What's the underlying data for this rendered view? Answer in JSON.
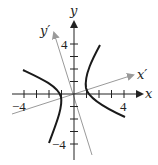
{
  "diagram": {
    "title": "",
    "colors": {
      "axis": "#222222",
      "rotated_axis": "#9a9a9a",
      "curve": "#1a1a1a",
      "background": "#ffffff"
    },
    "axes": {
      "x": {
        "label": "x",
        "tick_labels": [
          {
            "value": -4,
            "text": "−4"
          },
          {
            "value": 4,
            "text": "4"
          }
        ],
        "ticks": [
          -4,
          -3,
          -2,
          -1,
          1,
          2,
          3,
          4
        ]
      },
      "y": {
        "label": "y",
        "tick_labels": [
          {
            "value": 4,
            "text": "4"
          },
          {
            "value": -4,
            "text": "−4"
          }
        ],
        "ticks": [
          -4,
          -3,
          -2,
          -1,
          1,
          2,
          3,
          4
        ]
      },
      "x_prime": {
        "label": "x′"
      },
      "y_prime": {
        "label": "y′"
      }
    },
    "curve": {
      "type": "hyperbola",
      "branches": 2
    }
  }
}
